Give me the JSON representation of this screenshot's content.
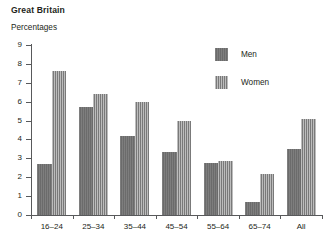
{
  "header": {
    "title": "Great Britain",
    "subtitle": "Percentages"
  },
  "legend": {
    "items": [
      {
        "label": "Men",
        "color": "#6f6f6f",
        "key": "men"
      },
      {
        "label": "Women",
        "color": "#949494",
        "key": "women"
      }
    ]
  },
  "axis": {
    "y_ticks": [
      "0",
      "1",
      "2",
      "3",
      "4",
      "5",
      "6",
      "7",
      "8",
      "9"
    ],
    "x_ticks": [
      "16–24",
      "25–34",
      "35–44",
      "45–54",
      "55–64",
      "65–74",
      "All"
    ]
  },
  "chart_data": {
    "type": "bar",
    "title": "Great Britain",
    "subtitle": "Percentages",
    "xlabel": "",
    "ylabel": "Percentages",
    "ylim": [
      0,
      9
    ],
    "ytick_step": 1,
    "grid": false,
    "legend_position": "top-right",
    "categories": [
      "16–24",
      "25–34",
      "35–44",
      "45–54",
      "55–64",
      "65–74",
      "All"
    ],
    "series": [
      {
        "name": "Men",
        "color": "#6f6f6f",
        "values": [
          2.7,
          5.7,
          4.2,
          3.35,
          2.75,
          0.7,
          3.5
        ]
      },
      {
        "name": "Women",
        "color": "#949494",
        "values": [
          7.6,
          6.4,
          6.0,
          5.0,
          2.85,
          2.15,
          5.1
        ]
      }
    ]
  }
}
